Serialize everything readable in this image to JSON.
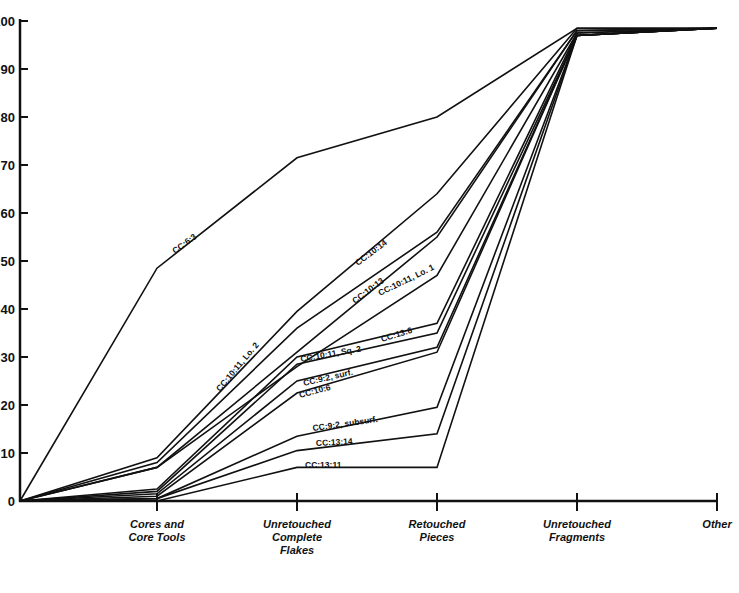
{
  "chart_data": {
    "type": "line",
    "title": "",
    "xlabel": "",
    "ylabel": "",
    "ylim": [
      0,
      100
    ],
    "yticks": [
      0,
      10,
      20,
      30,
      40,
      50,
      60,
      70,
      80,
      90,
      100
    ],
    "ytick_labels": [
      "0",
      "10",
      "20",
      "30",
      "40",
      "50",
      "60",
      "70",
      "80",
      "90",
      "100"
    ],
    "categories": [
      "",
      "Cores and Core Tools",
      "Unretouched Complete Flakes",
      "Retouched Pieces",
      "Unretouched Fragments",
      "Other"
    ],
    "category_label_lines": [
      [],
      [
        "Cores and",
        "Core Tools"
      ],
      [
        "Unretouched",
        "Complete",
        "Flakes"
      ],
      [
        "Retouched",
        "Pieces"
      ],
      [
        "Unretouched",
        "Fragments"
      ],
      [
        "Other"
      ]
    ],
    "grid": false,
    "legend": "inline labels along lines",
    "series": [
      {
        "name": "CC:6:3",
        "values": [
          0,
          48.5,
          71.5,
          80,
          98.5,
          98.5
        ],
        "label_pos": {
          "x": 175,
          "y": 254,
          "angle": -36
        }
      },
      {
        "name": "CC:10:11, Lo. 2",
        "values": [
          0,
          9,
          39.5,
          64,
          98.5,
          98.5
        ],
        "label_pos": {
          "x": 220,
          "y": 392,
          "angle": -50
        }
      },
      {
        "name": "CC:10:14",
        "values": [
          0,
          8,
          36,
          56,
          98,
          98.5
        ],
        "label_pos": {
          "x": 358,
          "y": 266,
          "angle": -37
        }
      },
      {
        "name": "CC:10:13",
        "values": [
          0,
          7,
          31,
          55,
          98,
          98.5
        ],
        "label_pos": {
          "x": 355,
          "y": 304,
          "angle": -37
        }
      },
      {
        "name": "CC:10:11, Lo. 1",
        "values": [
          0,
          7,
          28,
          47,
          97.5,
          98.5
        ],
        "label_pos": {
          "x": 380,
          "y": 296,
          "angle": -26
        }
      },
      {
        "name": "CC:13:6",
        "values": [
          0,
          2.5,
          30,
          37,
          97.5,
          98.5
        ],
        "label_pos": {
          "x": 382,
          "y": 342,
          "angle": -17
        }
      },
      {
        "name": "CC:10:11, Sq. 2",
        "values": [
          0,
          2,
          28.5,
          35,
          97,
          98.5
        ],
        "label_pos": {
          "x": 301,
          "y": 362,
          "angle": -10
        }
      },
      {
        "name": "CC:9:2, surf.",
        "values": [
          0,
          1.5,
          25,
          32,
          97,
          98.5
        ],
        "label_pos": {
          "x": 304,
          "y": 386,
          "angle": -13
        }
      },
      {
        "name": "CC:10:6",
        "values": [
          0,
          1,
          22.5,
          31,
          97,
          98.5
        ],
        "label_pos": {
          "x": 300,
          "y": 398,
          "angle": -15
        }
      },
      {
        "name": "CC:9:2, subsurf.",
        "values": [
          0,
          0.5,
          13.5,
          19.5,
          97,
          98.5
        ],
        "label_pos": {
          "x": 313,
          "y": 431,
          "angle": -8
        }
      },
      {
        "name": "CC:13:14",
        "values": [
          0,
          0.5,
          10.5,
          14,
          97,
          98.5
        ],
        "label_pos": {
          "x": 316,
          "y": 446,
          "angle": -3
        }
      },
      {
        "name": "CC:13:11",
        "values": [
          0,
          0,
          7,
          7,
          97,
          98.5
        ],
        "label_pos": {
          "x": 305,
          "y": 468,
          "angle": 0
        }
      }
    ]
  }
}
